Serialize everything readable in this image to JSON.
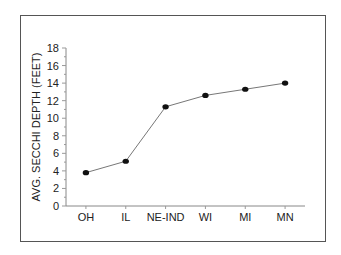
{
  "chart_data": {
    "type": "line",
    "title": "",
    "xlabel": "",
    "ylabel": "AVG. SECCHI DEPTH (FEET)",
    "categories": [
      "OH",
      "IL",
      "NE-IND",
      "WI",
      "MI",
      "MN"
    ],
    "values": [
      3.8,
      5.1,
      11.3,
      12.6,
      13.3,
      14.0
    ],
    "ylim": [
      0,
      18
    ],
    "yticks": [
      0,
      2,
      4,
      6,
      8,
      10,
      12,
      14,
      16,
      18
    ],
    "grid": false,
    "legend": null
  }
}
